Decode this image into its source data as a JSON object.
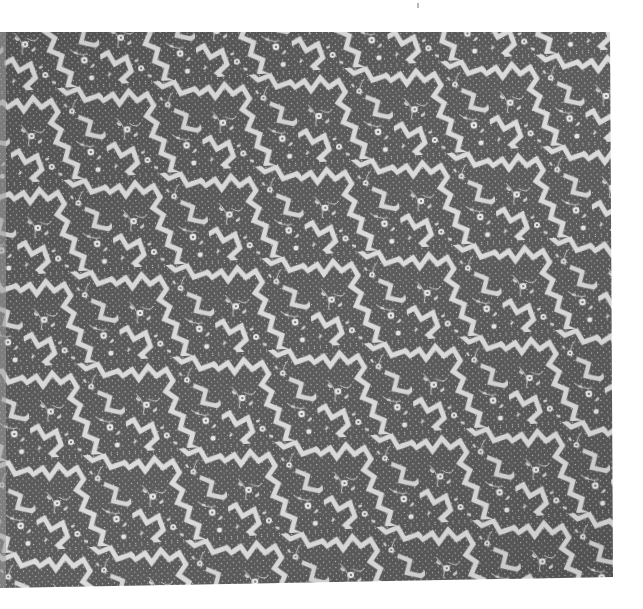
{
  "image": {
    "subject": "Patterned textile with jagged meandering bands and floral vine motifs",
    "palette": {
      "ground": "#575757",
      "ground_dark": "#4a4a4a",
      "motif": "#d9d9d9",
      "motif_light": "#ececec",
      "background": "#ffffff",
      "edge_strip": "#9c9c9c"
    },
    "textile_polygon": "0,32 610,32 613,577 0,588",
    "speck": {
      "x": 417,
      "y": 3
    }
  }
}
